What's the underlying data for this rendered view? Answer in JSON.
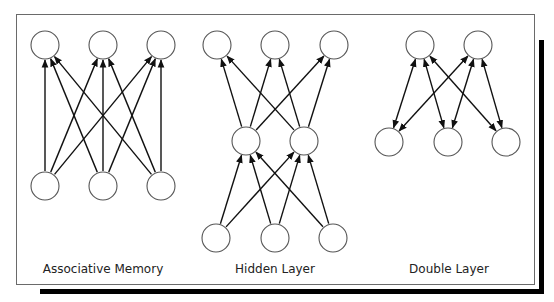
{
  "figure": {
    "panels": [
      {
        "id": "associative-memory",
        "label": "Associative Memory",
        "label_pos": [
          103,
          271
        ],
        "nodes": [
          {
            "id": "o1",
            "x": 45,
            "y": 45
          },
          {
            "id": "o2",
            "x": 103,
            "y": 45
          },
          {
            "id": "o3",
            "x": 161,
            "y": 45
          },
          {
            "id": "i1",
            "x": 45,
            "y": 186
          },
          {
            "id": "i2",
            "x": 103,
            "y": 186
          },
          {
            "id": "i3",
            "x": 161,
            "y": 186
          }
        ],
        "edges": [
          {
            "from": "i1",
            "to": "o1",
            "type": "forward"
          },
          {
            "from": "i1",
            "to": "o2",
            "type": "forward"
          },
          {
            "from": "i1",
            "to": "o3",
            "type": "forward"
          },
          {
            "from": "i2",
            "to": "o1",
            "type": "forward"
          },
          {
            "from": "i2",
            "to": "o2",
            "type": "forward"
          },
          {
            "from": "i2",
            "to": "o3",
            "type": "forward"
          },
          {
            "from": "i3",
            "to": "o1",
            "type": "forward"
          },
          {
            "from": "i3",
            "to": "o2",
            "type": "forward"
          },
          {
            "from": "i3",
            "to": "o3",
            "type": "forward"
          }
        ]
      },
      {
        "id": "hidden-layer",
        "label": "Hidden Layer",
        "label_pos": [
          275,
          271
        ],
        "nodes": [
          {
            "id": "o1",
            "x": 217,
            "y": 45
          },
          {
            "id": "o2",
            "x": 275,
            "y": 45
          },
          {
            "id": "o3",
            "x": 334,
            "y": 45
          },
          {
            "id": "h1",
            "x": 246,
            "y": 141
          },
          {
            "id": "h2",
            "x": 304,
            "y": 141
          },
          {
            "id": "i1",
            "x": 216,
            "y": 238
          },
          {
            "id": "i2",
            "x": 275,
            "y": 238
          },
          {
            "id": "i3",
            "x": 333,
            "y": 238
          }
        ],
        "edges": [
          {
            "from": "h1",
            "to": "o1",
            "type": "forward"
          },
          {
            "from": "h1",
            "to": "o2",
            "type": "forward"
          },
          {
            "from": "h1",
            "to": "o3",
            "type": "forward"
          },
          {
            "from": "h2",
            "to": "o1",
            "type": "forward"
          },
          {
            "from": "h2",
            "to": "o2",
            "type": "forward"
          },
          {
            "from": "h2",
            "to": "o3",
            "type": "forward"
          },
          {
            "from": "i1",
            "to": "h1",
            "type": "forward"
          },
          {
            "from": "i1",
            "to": "h2",
            "type": "forward"
          },
          {
            "from": "i2",
            "to": "h1",
            "type": "forward"
          },
          {
            "from": "i2",
            "to": "h2",
            "type": "forward"
          },
          {
            "from": "i3",
            "to": "h1",
            "type": "forward"
          },
          {
            "from": "i3",
            "to": "h2",
            "type": "forward"
          }
        ]
      },
      {
        "id": "double-layer",
        "label": "Double Layer",
        "label_pos": [
          449,
          271
        ],
        "nodes": [
          {
            "id": "t1",
            "x": 420,
            "y": 45
          },
          {
            "id": "t2",
            "x": 478,
            "y": 45
          },
          {
            "id": "b1",
            "x": 389,
            "y": 142
          },
          {
            "id": "b2",
            "x": 448,
            "y": 142
          },
          {
            "id": "b3",
            "x": 506,
            "y": 142
          }
        ],
        "edges": [
          {
            "from": "t1",
            "to": "b1",
            "type": "bidirectional"
          },
          {
            "from": "t1",
            "to": "b2",
            "type": "bidirectional"
          },
          {
            "from": "t1",
            "to": "b3",
            "type": "bidirectional"
          },
          {
            "from": "t2",
            "to": "b1",
            "type": "bidirectional"
          },
          {
            "from": "t2",
            "to": "b2",
            "type": "bidirectional"
          },
          {
            "from": "t2",
            "to": "b3",
            "type": "bidirectional"
          }
        ]
      }
    ],
    "node_radius": 14,
    "colors": {
      "node_stroke": "#555555",
      "edge": "#111111",
      "frame": "#6a6a6a",
      "shadow": "#000000"
    }
  }
}
